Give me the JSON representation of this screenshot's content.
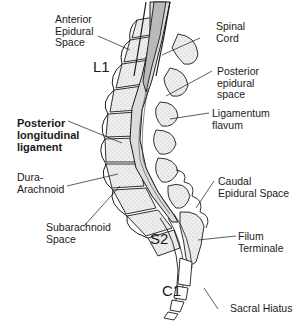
{
  "diagram": {
    "type": "anatomical-sagittal-section",
    "labels": {
      "anterior_epidural_space": [
        "Anterior",
        "Epidural",
        "Space"
      ],
      "spinal_cord": [
        "Spinal",
        "Cord"
      ],
      "posterior_epidural_space": [
        "Posterior",
        "epidural",
        "space"
      ],
      "ligamentum_flavum": [
        "Ligamentum",
        "flavum"
      ],
      "posterior_longitudinal_ligament": [
        "Posterior",
        "longitudinal",
        "ligament"
      ],
      "dura_arachnoid": [
        "Dura-",
        "Arachnoid"
      ],
      "subarachnoid_space": [
        "Subarachnoid",
        "Space"
      ],
      "caudal_epidural_space": [
        "Caudal",
        "Epidural Space"
      ],
      "filum_terminale": [
        "Filum",
        "Terminale"
      ],
      "sacral_hiatus": [
        "Sacral Hiatus"
      ]
    },
    "levels": {
      "l1": "L1",
      "s2": "S2",
      "c1": "C1"
    },
    "colors": {
      "outline": "#1a1a1a",
      "bone_fill": "#ececec",
      "bone_stipple": "#9a9a9a",
      "cord_fill": "#b9b9b9",
      "csf_fill": "#dcdcdc",
      "background": "#ffffff"
    }
  }
}
